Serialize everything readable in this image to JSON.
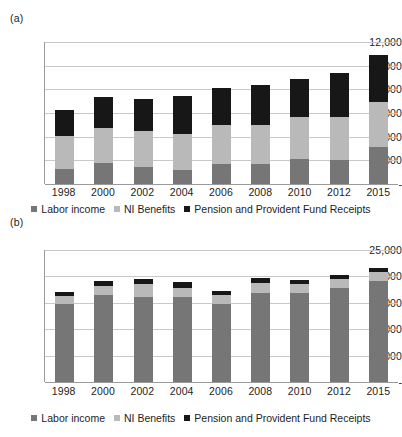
{
  "figure": {
    "panels": [
      {
        "tag": "(a)"
      },
      {
        "tag": "(b)"
      }
    ]
  },
  "legend": {
    "items": [
      {
        "label": "Labor income",
        "color": "#767676"
      },
      {
        "label": "NI Benefits",
        "color": "#b9b9b9"
      },
      {
        "label": "Pension and Provident Fund Receipts",
        "color": "#171717"
      }
    ]
  },
  "chart_data": [
    {
      "type": "bar",
      "id": "panel-a",
      "panel_tag": "(a)",
      "stacked": true,
      "title": "",
      "xlabel": "",
      "ylabel": "",
      "grid": true,
      "legend_position": "bottom",
      "categories": [
        "1998",
        "2000",
        "2002",
        "2004",
        "2006",
        "2008",
        "2010",
        "2012",
        "2015"
      ],
      "ylim": [
        0,
        12000
      ],
      "ytick_values": [
        12000,
        10000,
        8000,
        6000,
        4000,
        2000,
        0
      ],
      "ytick_labels": [
        "12,000",
        "10,000",
        "8,000",
        "6,000",
        "4,000",
        "2,000",
        "-"
      ],
      "series": [
        {
          "name": "Labor income",
          "color": "#767676",
          "values": [
            1250,
            1750,
            1400,
            1150,
            1700,
            1700,
            2100,
            2050,
            3150
          ]
        },
        {
          "name": "NI Benefits",
          "color": "#b9b9b9",
          "values": [
            2850,
            2950,
            3100,
            3100,
            3300,
            3300,
            3600,
            3650,
            3800
          ]
        },
        {
          "name": "Pension and Provident Fund Receipts",
          "color": "#171717",
          "values": [
            2150,
            2650,
            2700,
            3150,
            3100,
            3400,
            3150,
            3700,
            3950
          ]
        }
      ],
      "totals": [
        6250,
        7350,
        7200,
        7400,
        8100,
        8400,
        8850,
        9400,
        10900
      ]
    },
    {
      "type": "bar",
      "id": "panel-b",
      "panel_tag": "(b)",
      "stacked": true,
      "title": "",
      "xlabel": "",
      "ylabel": "",
      "grid": true,
      "legend_position": "bottom",
      "categories": [
        "1998",
        "2000",
        "2002",
        "2004",
        "2006",
        "2008",
        "2010",
        "2012",
        "2015"
      ],
      "ylim": [
        0,
        25000
      ],
      "ytick_values": [
        25000,
        20000,
        15000,
        10000,
        5000,
        0
      ],
      "ytick_labels": [
        "25,000",
        "20,000",
        "15,000",
        "10,000",
        "5,000",
        "-"
      ],
      "series": [
        {
          "name": "Labor income",
          "color": "#767676",
          "values": [
            14700,
            16400,
            16100,
            16150,
            14750,
            16800,
            16800,
            17800,
            19150
          ]
        },
        {
          "name": "NI Benefits",
          "color": "#b9b9b9",
          "values": [
            1500,
            1750,
            2400,
            1750,
            1750,
            2000,
            1850,
            1700,
            1600
          ]
        },
        {
          "name": "Pension and Provident Fund Receipts",
          "color": "#171717",
          "values": [
            900,
            950,
            1050,
            1000,
            800,
            950,
            750,
            800,
            800
          ]
        }
      ],
      "totals": [
        17100,
        19100,
        19550,
        18900,
        17300,
        19750,
        19400,
        20300,
        21550
      ]
    }
  ]
}
